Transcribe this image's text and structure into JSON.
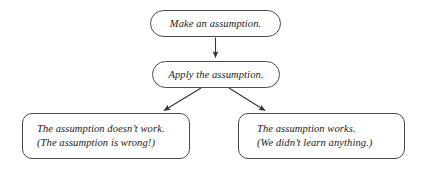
{
  "diagram": {
    "background_color": "#ffffff",
    "stroke_color": "#4a4a4a",
    "text_color": "#1a1a1a",
    "nodes": {
      "make": {
        "shape": "pill",
        "text": "Make an assumption."
      },
      "apply": {
        "shape": "pill",
        "text": "Apply the assumption."
      },
      "fail": {
        "shape": "rounded-rect",
        "line1": "The assumption doesn’t work.",
        "line2": "(The assumption is wrong!)"
      },
      "succeed": {
        "shape": "rounded-rect",
        "line1": "The assumption works.",
        "line2": "(We didn’t learn anything.)"
      }
    },
    "edges": [
      {
        "name": "make-to-apply",
        "from": "make",
        "to": "apply",
        "direction": "down"
      },
      {
        "name": "apply-to-fail",
        "from": "apply",
        "to": "fail",
        "direction": "down-left"
      },
      {
        "name": "apply-to-succeed",
        "from": "apply",
        "to": "succeed",
        "direction": "down-right"
      }
    ]
  }
}
